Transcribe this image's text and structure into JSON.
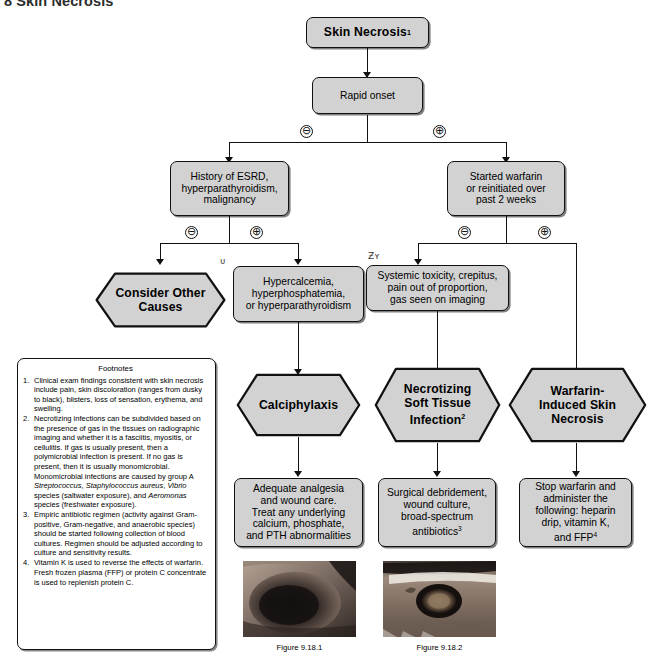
{
  "page": {
    "header_title": "8  Skin Necrosis"
  },
  "nodes": {
    "root": {
      "label": "Skin Necrosis",
      "sup": "1",
      "shape": "rect-bold"
    },
    "rapid_onset": {
      "label": "Rapid onset",
      "sup": "",
      "shape": "rect"
    },
    "esrd": {
      "label": "History of ESRD,\nhyperparathyroidism,\nmalignancy",
      "sup": "",
      "shape": "rect"
    },
    "warfarin": {
      "label": "Started warfarin\nor reinitiated over\npast 2 weeks",
      "sup": "",
      "shape": "rect"
    },
    "other_causes": {
      "label": "Consider Other\nCauses",
      "sup": "",
      "shape": "hex"
    },
    "hypercalcemia": {
      "label": "Hypercalcemia,\nhyperphosphatemia,\nor hyperparathyroidism",
      "sup": "",
      "shape": "rect"
    },
    "systemic_tox": {
      "label": "Systemic toxicity, crepitus,\npain out of proportion,\ngas seen on imaging",
      "sup": "",
      "shape": "rect"
    },
    "calciphylaxis": {
      "label": "Calciphylaxis",
      "sup": "",
      "shape": "hex"
    },
    "nsti": {
      "label": "Necrotizing\nSoft Tissue\nInfection",
      "sup": "2",
      "shape": "hex"
    },
    "wisn": {
      "label": "Warfarin-\nInduced Skin\nNecrosis",
      "sup": "",
      "shape": "hex"
    },
    "tx_calci": {
      "label": "Adequate analgesia\nand wound care.\nTreat any underlying\ncalcium, phosphate,\nand PTH abnormalities",
      "sup": "",
      "shape": "rect"
    },
    "tx_nsti": {
      "label": "Surgical debridement,\nwound culture,\nbroad-spectrum\nantibiotics",
      "sup": "3",
      "shape": "rect"
    },
    "tx_wisn": {
      "label": "Stop warfarin and\nadminister the\nfollowing: heparin\ndrip, vitamin K,\nand FFP",
      "sup": "4",
      "shape": "rect"
    }
  },
  "branch_signs": {
    "rapid_minus": "⊖",
    "rapid_plus": "⊕",
    "esrd_minus": "⊖",
    "esrd_plus": "⊕",
    "warfarin_minus": "⊖",
    "warfarin_plus": "⊕"
  },
  "footnotes": {
    "title": "Footnotes",
    "items": [
      {
        "num": "1.",
        "html": "Clinical exam findings consistent with skin necrosis include pain, skin discoloration (ranges from dusky to black), blisters, loss of sensation, erythema, and swelling."
      },
      {
        "num": "2.",
        "html": "Necrotizing infections can be subdivided based on the presence of gas in the tissues on radiographic imaging and whether it is a fasciitis, myositis, or cellulitis. If gas is usually present, then a polymicrobial infection is present. If no gas is present, then it is usually monomicrobial. Monomicrobial infections are caused by group A <i>Streptococcus</i>, <i>Staphylococcus aureus</i>, <i>Vibrio</i> species (saltwater exposure), and <i>Aeromonas</i> species (freshwater exposure)."
      },
      {
        "num": "3.",
        "html": "Empiric antibiotic regimen (activity against Gram-positive, Gram-negative, and anaerobic species) should be started following collection of blood cultures. Regimen should be adjusted according to culture and sensitivity results."
      },
      {
        "num": "4.",
        "html": "Vitamin K is used to reverse the effects of warfarin. Fresh frozen plasma (FFP) or protein C concentrate is used to replenish protein C."
      }
    ]
  },
  "figures": [
    {
      "caption": "Figure 9.18.1",
      "alt": "clinical-photo-calciphylaxis"
    },
    {
      "caption": "Figure 9.18.2",
      "alt": "clinical-photo-necrotizing-soft-tissue-infection"
    }
  ],
  "artifacts": {
    "mark_a": "ᴜ",
    "mark_b": "Ƶʏ"
  },
  "colors": {
    "node_fill": "#d2d2d2",
    "node_stroke": "#111111",
    "page_bg": "#ffffff",
    "header_text": "#2c2c2c"
  }
}
